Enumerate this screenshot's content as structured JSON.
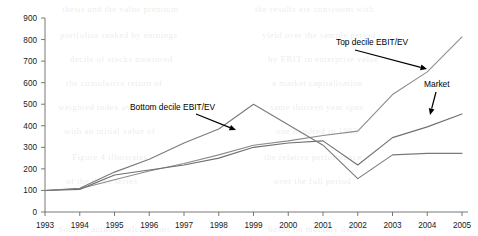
{
  "chart_data": {
    "type": "line",
    "title": "",
    "xlabel": "",
    "ylabel": "",
    "x": [
      1993,
      1994,
      1995,
      1996,
      1997,
      1998,
      1999,
      2000,
      2001,
      2002,
      2003,
      2004,
      2005
    ],
    "categories": [
      "1993",
      "1994",
      "1995",
      "1996",
      "1997",
      "1998",
      "1999",
      "2000",
      "2001",
      "2002",
      "2003",
      "2004",
      "2005"
    ],
    "xlim": [
      1993,
      2005
    ],
    "ylim": [
      0,
      900
    ],
    "yticks": [
      0,
      100,
      200,
      300,
      400,
      500,
      600,
      700,
      800,
      900
    ],
    "ytick_labels": [
      "0",
      "100",
      "200",
      "300",
      "400",
      "500",
      "600",
      "700",
      "800",
      "900"
    ],
    "grid": false,
    "legend": "none (inline annotations with arrows)",
    "series": [
      {
        "name": "Top decile EBIT/EV",
        "color": "#8c8c8c",
        "values": [
          100,
          108,
          150,
          190,
          225,
          265,
          310,
          330,
          355,
          375,
          545,
          650,
          812
        ]
      },
      {
        "name": "Market",
        "color": "#707070",
        "values": [
          100,
          105,
          172,
          195,
          218,
          250,
          300,
          320,
          330,
          218,
          345,
          395,
          455
        ]
      },
      {
        "name": "Bottom decile EBIT/EV",
        "color": "#7a7a7a",
        "values": [
          100,
          110,
          185,
          245,
          320,
          385,
          500,
          405,
          310,
          155,
          265,
          272,
          272
        ]
      }
    ],
    "annotations": [
      {
        "label": "Bottom decile EBIT/EV",
        "text_x": 130,
        "text_y": 110,
        "arrow_from_x": 196,
        "arrow_from_y": 114,
        "arrow_to_x": 236,
        "arrow_to_y": 130
      },
      {
        "label": "Top decile EBIT/EV",
        "text_x": 336,
        "text_y": 45,
        "arrow_from_x": 355,
        "arrow_from_y": 50,
        "arrow_to_x": 427,
        "arrow_to_y": 69
      },
      {
        "label": "Market",
        "text_x": 424,
        "text_y": 87,
        "arrow_from_x": 436,
        "arrow_from_y": 92,
        "arrow_to_x": 430,
        "arrow_to_y": 115
      }
    ]
  },
  "background_bleed": [
    {
      "text": "thesis and the value premium",
      "x": 62,
      "y": 4
    },
    {
      "text": "the results are consistent with",
      "x": 255,
      "y": 4
    },
    {
      "text": "portfolios ranked by earnings",
      "x": 60,
      "y": 30
    },
    {
      "text": "yield over the sample period",
      "x": 262,
      "y": 30
    },
    {
      "text": "decile of stocks measured",
      "x": 70,
      "y": 54
    },
    {
      "text": "by EBIT to enterprise value",
      "x": 268,
      "y": 54
    },
    {
      "text": "the cumulative return of",
      "x": 66,
      "y": 78
    },
    {
      "text": "a market capitalisation",
      "x": 272,
      "y": 78
    },
    {
      "text": "weighted index over the",
      "x": 58,
      "y": 102
    },
    {
      "text": "same thirteen year span",
      "x": 270,
      "y": 102
    },
    {
      "text": "with an initial value of",
      "x": 64,
      "y": 126
    },
    {
      "text": "one hundred in 1993",
      "x": 276,
      "y": 126
    },
    {
      "text": "Figure 4 illustrates",
      "x": 72,
      "y": 152
    },
    {
      "text": "the relative performance",
      "x": 264,
      "y": 152
    },
    {
      "text": "of the three series",
      "x": 66,
      "y": 176
    },
    {
      "text": "over the full period",
      "x": 274,
      "y": 176
    },
    {
      "text": "Source: authors calculations",
      "x": 58,
      "y": 224
    },
    {
      "text": "based on monthly data",
      "x": 268,
      "y": 224
    }
  ]
}
